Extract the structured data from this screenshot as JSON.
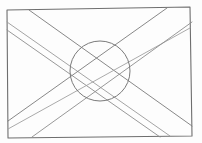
{
  "image": {
    "subject": "pencil sketch of a flag",
    "width": 202,
    "height": 143,
    "background": "#fdfdfd"
  },
  "sketch": {
    "border": {
      "points": [
        [
          7,
          10
        ],
        [
          190,
          7
        ],
        [
          192,
          136
        ],
        [
          8,
          138
        ]
      ],
      "color": "#6e6e6e",
      "width": 1.1
    },
    "band_descending": {
      "lines": [
        {
          "x1": 29,
          "y1": 10,
          "x2": 192,
          "y2": 126,
          "color": "#7a7a7a"
        },
        {
          "x1": 7,
          "y1": 22,
          "x2": 170,
          "y2": 136,
          "color": "#9a9a9a"
        },
        {
          "x1": 7,
          "y1": 30,
          "x2": 160,
          "y2": 137,
          "color": "#8c8c8c"
        }
      ]
    },
    "band_ascending": {
      "lines": [
        {
          "x1": 8,
          "y1": 121,
          "x2": 167,
          "y2": 8,
          "color": "#7a7a7a"
        },
        {
          "x1": 8,
          "y1": 129,
          "x2": 190,
          "y2": 28,
          "color": "#a0a0a0"
        },
        {
          "x1": 32,
          "y1": 137,
          "x2": 192,
          "y2": 22,
          "color": "#8c8c8c"
        }
      ]
    },
    "circle": {
      "cx": 100,
      "cy": 71,
      "r": 30,
      "color": "#7a7a7a",
      "width": 1
    }
  }
}
